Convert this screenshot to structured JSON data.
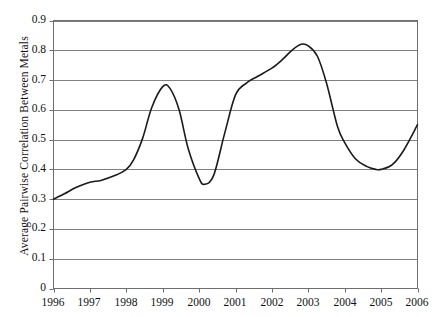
{
  "chart_data": {
    "type": "line",
    "title": "",
    "xlabel": "",
    "ylabel": "Average Pairwise Correlation Between Metals",
    "xlim": [
      1996,
      2006
    ],
    "ylim": [
      0,
      0.9
    ],
    "grid": "horizontal",
    "legend": "none",
    "line_color": "#1a1a1a",
    "grid_color": "#808080",
    "axis_color": "#6e6e6e",
    "x_tick_labels": [
      "1996",
      "1997",
      "1998",
      "1999",
      "2000",
      "2001",
      "2002",
      "2003",
      "2004",
      "2005",
      "2006"
    ],
    "y_tick_labels": [
      "0.9",
      "0.8",
      "0.7",
      "0.6",
      "0.5",
      "0.4",
      "0.3",
      "0.2",
      "0.1",
      "0"
    ],
    "y_tick_values": [
      0.9,
      0.8,
      0.7,
      0.6,
      0.5,
      0.4,
      0.3,
      0.2,
      0.1,
      0
    ],
    "series": [
      {
        "name": "Average Pairwise Correlation Between Metals",
        "x": [
          1996.0,
          1996.3,
          1996.6,
          1997.0,
          1997.3,
          1997.7,
          1998.0,
          1998.2,
          1998.45,
          1998.7,
          1999.0,
          1999.2,
          1999.45,
          1999.7,
          2000.0,
          2000.15,
          2000.4,
          2000.7,
          2001.0,
          2001.3,
          2001.6,
          2002.0,
          2002.3,
          2002.55,
          2002.8,
          2003.0,
          2003.25,
          2003.5,
          2003.8,
          2004.0,
          2004.3,
          2004.6,
          2004.85,
          2005.0,
          2005.3,
          2005.6,
          2006.0
        ],
        "y": [
          0.3,
          0.318,
          0.338,
          0.357,
          0.363,
          0.38,
          0.4,
          0.432,
          0.505,
          0.608,
          0.678,
          0.672,
          0.6,
          0.47,
          0.37,
          0.35,
          0.38,
          0.52,
          0.65,
          0.69,
          0.712,
          0.74,
          0.77,
          0.8,
          0.82,
          0.815,
          0.78,
          0.69,
          0.545,
          0.49,
          0.435,
          0.41,
          0.4,
          0.4,
          0.415,
          0.46,
          0.55
        ]
      }
    ]
  },
  "axes": {
    "caption_fragment": ""
  }
}
